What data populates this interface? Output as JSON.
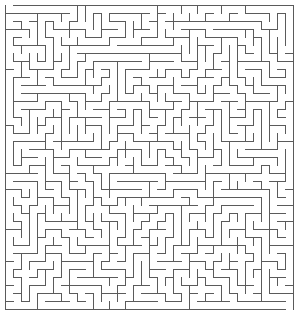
{
  "puzzle": {
    "type": "maze",
    "style": "orthogonal grid maze, thin gray walls on white background",
    "grid": {
      "columns": 36,
      "rows": 38,
      "cell_size_px": 8,
      "origin_x": 5,
      "origin_y": 5
    },
    "colors": {
      "background": "#ffffff",
      "wall": "#5a5a5a"
    },
    "wall_width_px": 1,
    "openings": {
      "entrance": {
        "side": "top",
        "column": 0
      },
      "exit": {
        "side": "bottom",
        "column": 35
      }
    },
    "seed": 20240611
  }
}
